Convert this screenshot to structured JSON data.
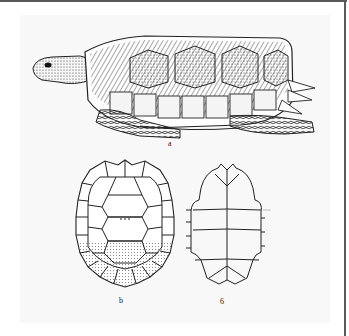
{
  "figure": {
    "panels": [
      {
        "id": "a",
        "label": "a",
        "subject": "turtle-lateral-view"
      },
      {
        "id": "b",
        "label": "b",
        "subject": "carapace-dorsal-view"
      },
      {
        "id": "c",
        "label": "6",
        "subject": "plastron-ventral-view"
      }
    ]
  },
  "colors": {
    "frame": "#5a5a5a",
    "panel_bg": "#f8f8f8",
    "ink": "#1a1a1a",
    "stipple": "#9a9a9a"
  }
}
